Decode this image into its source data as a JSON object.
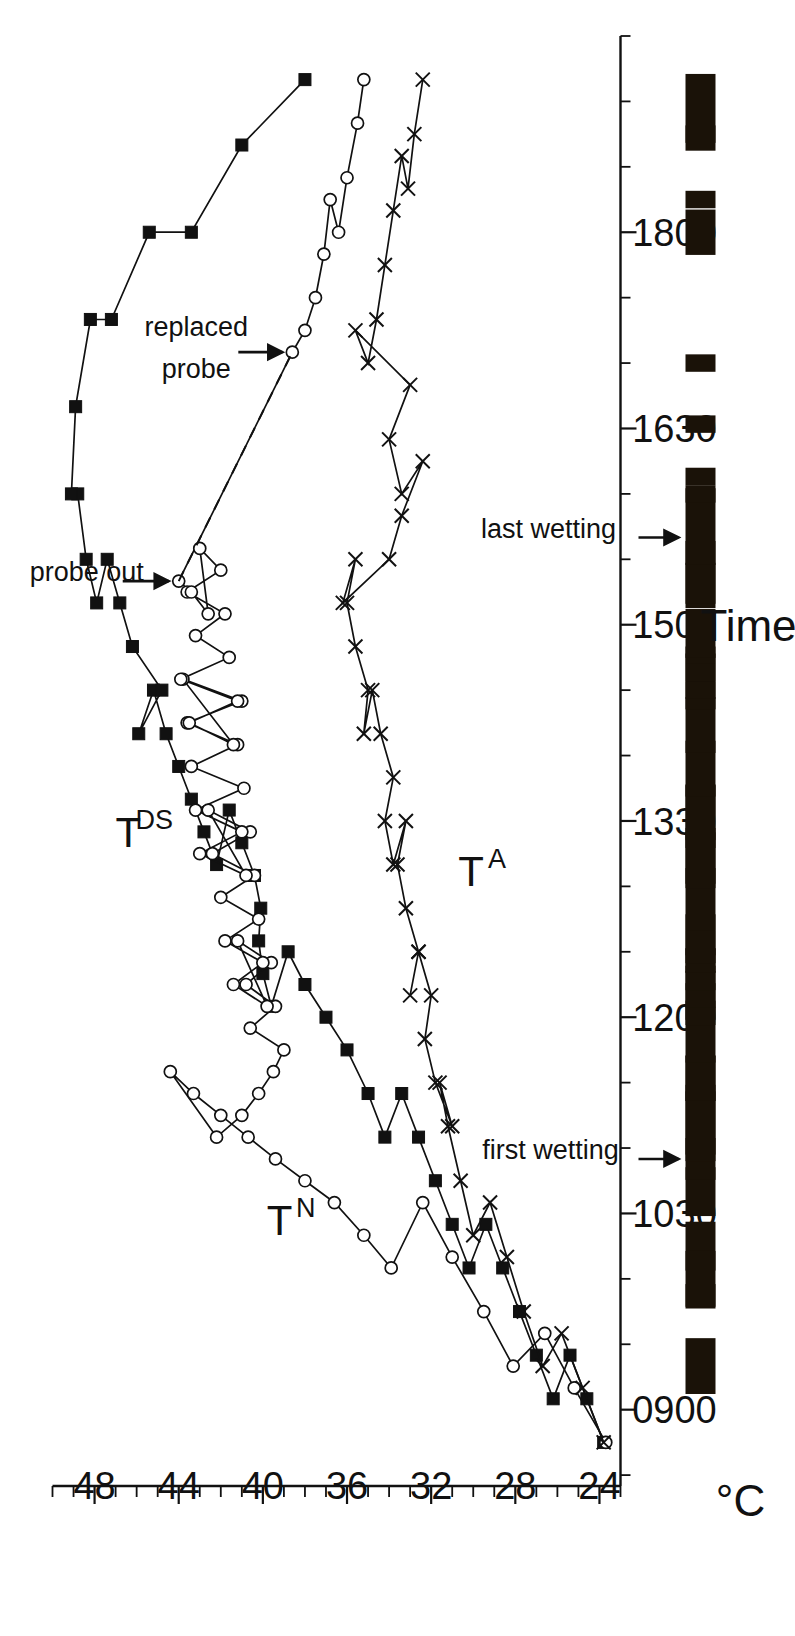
{
  "figure": {
    "orientation": "rotated-90-ccw",
    "background_color": "#ffffff",
    "ink_color": "#111111"
  },
  "chart_data": {
    "type": "line",
    "title": "",
    "subtitle": "",
    "xlabel": "Time",
    "ylabel": "°C",
    "xlim": [
      825,
      1890
    ],
    "ylim": [
      23,
      50
    ],
    "grid": false,
    "legend_position": "inline-labels",
    "x_tick_labels": [
      "0900",
      "1030",
      "1200",
      "1330",
      "1500",
      "1630",
      "1800"
    ],
    "x_tick_values": [
      900,
      1030,
      1200,
      1330,
      1500,
      1630,
      1800
    ],
    "x_minor_interval_minutes": 15,
    "y_tick_labels": [
      "24",
      "28",
      "32",
      "36",
      "40",
      "44",
      "48"
    ],
    "y_tick_values": [
      24,
      28,
      32,
      36,
      40,
      44,
      48
    ],
    "y_minor_interval": 1,
    "y_axis_end": 50,
    "series": [
      {
        "name": "T_DS",
        "label_main": "T",
        "label_sub": "DS",
        "marker": "filled-square",
        "line_style": "solid",
        "x": [
          845,
          865,
          885,
          905,
          925,
          945,
          965,
          985,
          1005,
          1025,
          1045,
          1065,
          1085,
          1105,
          1125,
          1145,
          1160,
          1175,
          1190,
          1205,
          1220,
          1235,
          1250,
          1265,
          1280,
          1295,
          1310,
          1325,
          1340,
          1355,
          1370,
          1390,
          1410,
          1430,
          1450,
          1470,
          1490,
          1510,
          1530,
          1560,
          1600,
          1640,
          1680,
          1720,
          1760,
          1800,
          1840,
          1870
        ],
        "values": [
          23.8,
          24.6,
          25.4,
          26.2,
          27.0,
          27.8,
          28.6,
          29.4,
          30.2,
          31.0,
          31.8,
          32.6,
          33.4,
          34.2,
          35.0,
          36.0,
          37.0,
          38.0,
          38.8,
          39.6,
          40.0,
          40.2,
          40.1,
          40.4,
          41.0,
          41.6,
          42.2,
          42.8,
          43.4,
          44.0,
          44.6,
          45.2,
          45.9,
          44.8,
          46.2,
          46.8,
          47.4,
          47.9,
          48.4,
          48.8,
          49.1,
          48.9,
          48.2,
          47.2,
          45.4,
          43.4,
          41.0,
          38.0
        ]
      },
      {
        "name": "T_N",
        "label_main": "T",
        "label_sub": "N",
        "marker": "open-circle",
        "line_style": "solid",
        "note": "strong high-frequency oscillation between about 1130 and 1520 caused by intermittent wetting; probe out at 1520, probe replaced at 1705",
        "x": [
          845,
          870,
          895,
          920,
          945,
          970,
          995,
          1005,
          1020,
          1035,
          1045,
          1055,
          1065,
          1075,
          1085,
          1095,
          1105,
          1115,
          1125,
          1135,
          1145,
          1155,
          1165,
          1175,
          1185,
          1195,
          1205,
          1215,
          1225,
          1235,
          1245,
          1255,
          1265,
          1275,
          1285,
          1295,
          1305,
          1315,
          1325,
          1335,
          1345,
          1355,
          1365,
          1375,
          1385,
          1395,
          1405,
          1415,
          1425,
          1435,
          1445,
          1455,
          1465,
          1475,
          1485,
          1495,
          1505,
          1515,
          1520,
          1705,
          1715,
          1730,
          1750,
          1775,
          1800,
          1825,
          1850,
          1870
        ],
        "values": [
          23.7,
          25.2,
          26.6,
          28.1,
          29.5,
          31.0,
          32.4,
          33.9,
          35.2,
          36.6,
          38.0,
          39.4,
          40.7,
          42.0,
          43.3,
          44.4,
          42.2,
          41.0,
          40.2,
          39.5,
          39.0,
          40.6,
          39.4,
          40.8,
          39.6,
          41.2,
          39.8,
          41.4,
          40.0,
          41.8,
          40.2,
          42.0,
          40.4,
          42.4,
          40.6,
          42.6,
          40.8,
          43.0,
          41.0,
          43.2,
          40.9,
          43.4,
          41.2,
          43.6,
          41.0,
          43.8,
          41.4,
          43.5,
          41.2,
          43.9,
          41.6,
          43.2,
          41.8,
          43.6,
          42.0,
          43.0,
          42.6,
          43.4,
          44.0,
          38.6,
          38.0,
          37.5,
          37.1,
          36.8,
          36.4,
          36.0,
          35.5,
          35.2
        ]
      },
      {
        "name": "T_A",
        "label_main": "T",
        "label_sub": "A",
        "marker": "cross",
        "line_style": "solid",
        "x": [
          845,
          870,
          895,
          920,
          945,
          970,
          995,
          1020,
          1045,
          1070,
          1090,
          1110,
          1130,
          1150,
          1170,
          1190,
          1210,
          1230,
          1250,
          1270,
          1290,
          1310,
          1330,
          1350,
          1370,
          1390,
          1410,
          1430,
          1450,
          1470,
          1490,
          1510,
          1530,
          1550,
          1575,
          1600,
          1625,
          1650,
          1675,
          1700,
          1720,
          1745,
          1770,
          1795,
          1820,
          1845,
          1870
        ],
        "values": [
          23.8,
          24.8,
          25.8,
          26.7,
          27.6,
          28.4,
          29.2,
          30.0,
          30.6,
          31.2,
          31.6,
          31.0,
          31.8,
          32.3,
          32.0,
          32.6,
          33.0,
          32.6,
          33.2,
          33.6,
          33.2,
          33.8,
          34.2,
          33.8,
          34.4,
          34.8,
          35.2,
          35.0,
          35.6,
          36.0,
          35.6,
          36.2,
          34.0,
          33.4,
          32.4,
          33.4,
          34.0,
          33.0,
          35.6,
          35.0,
          34.6,
          34.2,
          33.8,
          33.4,
          33.1,
          32.8,
          32.4
        ]
      }
    ],
    "dashed_connector": {
      "from_label": "probe out",
      "to_label": "probe replaced",
      "from": {
        "x": 1520,
        "y": 44.0
      },
      "to": {
        "x": 1705,
        "y": 38.6
      }
    },
    "annotations": [
      {
        "id": "probe-out",
        "text": "probe out",
        "x": 1520,
        "y": 44.0,
        "arrow": true
      },
      {
        "id": "probe-replaced",
        "text": "probe replaced",
        "x": 1705,
        "y": 38.6,
        "arrow": true
      },
      {
        "id": "first-wetting",
        "text": "first wetting",
        "x": 1055,
        "arrow": true,
        "track": "events"
      },
      {
        "id": "last-wetting",
        "text": "last wetting",
        "x": 1540,
        "arrow": true,
        "track": "events"
      }
    ],
    "event_track": {
      "name": "wetting-events",
      "description": "Black bars above the time axis marking wetting (sprinkler) events",
      "bars": [
        {
          "x": 880,
          "w": 16
        },
        {
          "x": 952,
          "w": 7
        },
        {
          "x": 975,
          "w": 14
        },
        {
          "x": 1000,
          "w": 16
        },
        {
          "x": 1040,
          "w": 14
        },
        {
          "x": 1055,
          "w": 12
        },
        {
          "x": 1073,
          "w": 20
        },
        {
          "x": 1092,
          "w": 13
        },
        {
          "x": 1110,
          "w": 20
        },
        {
          "x": 1132,
          "w": 13
        },
        {
          "x": 1152,
          "w": 16
        },
        {
          "x": 1170,
          "w": 14
        },
        {
          "x": 1186,
          "w": 7
        },
        {
          "x": 1194,
          "w": 7
        },
        {
          "x": 1202,
          "w": 7
        },
        {
          "x": 1210,
          "w": 7
        },
        {
          "x": 1218,
          "w": 7
        },
        {
          "x": 1226,
          "w": 7
        },
        {
          "x": 1236,
          "w": 14
        },
        {
          "x": 1254,
          "w": 18
        },
        {
          "x": 1274,
          "w": 16
        },
        {
          "x": 1294,
          "w": 16
        },
        {
          "x": 1312,
          "w": 16
        },
        {
          "x": 1332,
          "w": 18
        },
        {
          "x": 1354,
          "w": 16
        },
        {
          "x": 1374,
          "w": 16
        },
        {
          "x": 1394,
          "w": 16
        },
        {
          "x": 1430,
          "w": 5
        },
        {
          "x": 1438,
          "w": 5
        },
        {
          "x": 1446,
          "w": 5
        },
        {
          "x": 1456,
          "w": 14
        },
        {
          "x": 1478,
          "w": 13
        },
        {
          "x": 1524,
          "w": 18
        },
        {
          "x": 1545,
          "w": 22
        },
        {
          "x": 1592,
          "w": 5
        },
        {
          "x": 1600,
          "w": 5
        },
        {
          "x": 1608,
          "w": 5
        },
        {
          "x": 1700,
          "w": 5
        },
        {
          "x": 1775,
          "w": 5
        },
        {
          "x": 1800,
          "w": 13
        },
        {
          "x": 1845,
          "w": 5
        },
        {
          "x": 1855,
          "w": 22
        }
      ]
    }
  }
}
